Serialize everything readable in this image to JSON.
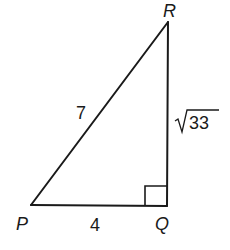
{
  "figure": {
    "type": "right-triangle",
    "stroke_color": "#1a1a1a",
    "background": "#ffffff",
    "vertices": {
      "P": {
        "label": "P",
        "x": 31,
        "y": 205
      },
      "Q": {
        "label": "Q",
        "x": 167,
        "y": 206
      },
      "R": {
        "label": "R",
        "x": 168,
        "y": 22
      }
    },
    "right_angle_at": "Q",
    "sides": {
      "PQ": {
        "label": "4"
      },
      "PR": {
        "label": "7"
      },
      "QR": {
        "label_radicand": "33",
        "label_symbol": "√"
      }
    }
  }
}
